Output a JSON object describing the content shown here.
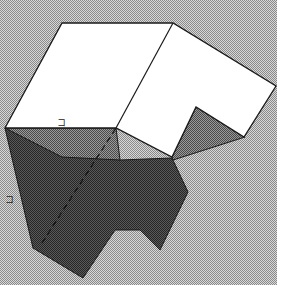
{
  "diagram": {
    "type": "3d-solid-net-fold",
    "colors": {
      "background": "#b4b4b4",
      "border_strip": "#ffffff",
      "top_face": "#ffffff",
      "mid_face": "#7a7a7a",
      "dark_face": "#3e3e3e",
      "edge": "#1a1a1a"
    },
    "labels": [
      {
        "id": "top-edge-label",
        "text": "コ"
      },
      {
        "id": "side-edge-label",
        "text": "コ"
      }
    ]
  }
}
